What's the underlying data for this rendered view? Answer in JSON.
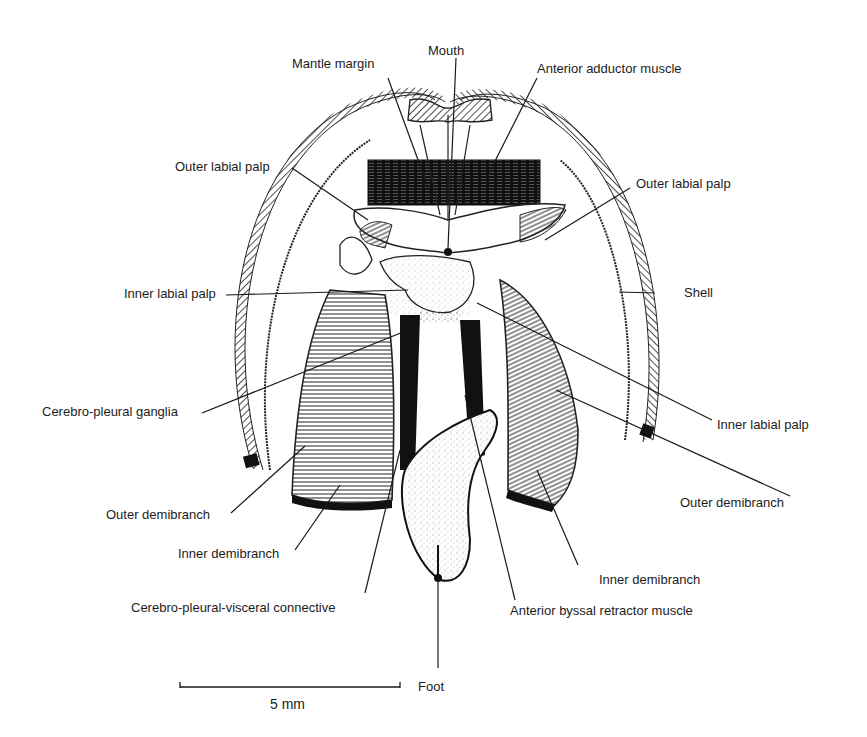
{
  "figure": {
    "type": "anatomical-illustration",
    "labels": {
      "mouth": "Mouth",
      "mantle_margin": "Mantle margin",
      "anterior_adductor_muscle": "Anterior adductor muscle",
      "outer_labial_palp_left": "Outer labial palp",
      "outer_labial_palp_right": "Outer labial palp",
      "inner_labial_palp_left": "Inner labial palp",
      "inner_labial_palp_right": "Inner labial palp",
      "shell": "Shell",
      "cerebro_pleural_ganglia": "Cerebro-pleural ganglia",
      "outer_demibranch_left": "Outer demibranch",
      "outer_demibranch_right": "Outer demibranch",
      "inner_demibranch_left": "Inner demibranch",
      "inner_demibranch_right": "Inner demibranch",
      "cerebro_pleural_visceral_connective": "Cerebro-pleural-visceral connective",
      "anterior_byssal_retractor_muscle": "Anterior byssal retractor muscle",
      "foot": "Foot"
    },
    "scale_bar": {
      "label": "5 mm"
    }
  }
}
